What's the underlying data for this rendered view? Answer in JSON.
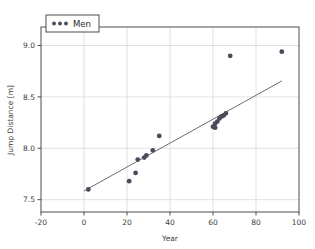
{
  "chart_data": {
    "type": "scatter",
    "title": "",
    "xlabel": "Year",
    "ylabel": "Jump Distance [m]",
    "xlim": [
      -20,
      100
    ],
    "ylim": [
      7.38,
      9.18
    ],
    "xticks": [
      -20,
      0,
      20,
      40,
      60,
      80,
      100
    ],
    "xtick_labels": [
      "-20",
      "0",
      "20",
      "40",
      "60",
      "80",
      "100"
    ],
    "yticks": [
      7.5,
      8.0,
      8.5,
      9.0
    ],
    "ytick_labels": [
      "7.5",
      "8.0",
      "8.5",
      "9.0"
    ],
    "grid": true,
    "legend_position": "upper left",
    "series": [
      {
        "name": "Men",
        "marker": "circle",
        "color": "#4a4a5a",
        "x": [
          2,
          21,
          24,
          25,
          28,
          29,
          32,
          35,
          60,
          61,
          61,
          62,
          63,
          64,
          65,
          66,
          68,
          92
        ],
        "y": [
          7.6,
          7.68,
          7.76,
          7.89,
          7.91,
          7.93,
          7.98,
          8.12,
          8.21,
          8.2,
          8.24,
          8.26,
          8.29,
          8.31,
          8.32,
          8.34,
          8.9,
          8.94
        ]
      }
    ],
    "fit_line": {
      "name": "linear-fit",
      "color": "#5a5a6a",
      "x": [
        0,
        92
      ],
      "y": [
        7.585,
        8.655
      ]
    }
  },
  "legend": {
    "entries": [
      {
        "label": "Men",
        "color": "#4a4a5a"
      }
    ]
  }
}
